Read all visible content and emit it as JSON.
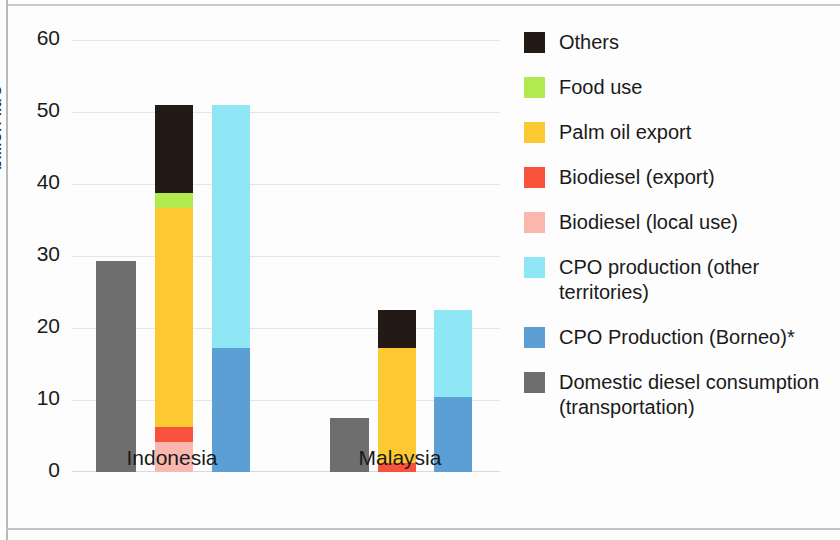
{
  "chart_data": {
    "type": "bar",
    "title": "",
    "subtitle": "",
    "xlabel": "",
    "ylabel": "billion litre",
    "ylim": [
      0,
      60
    ],
    "yticks": [
      0,
      10,
      20,
      30,
      40,
      50,
      60
    ],
    "ytick_labels": [
      "0",
      "10",
      "20",
      "30",
      "40",
      "50",
      "60"
    ],
    "grid": true,
    "legend_position": "right",
    "categories": [
      "Indonesia",
      "Malaysia"
    ],
    "stacked": true,
    "note": "* asterisk on CPO Production (Borneo) legend entry",
    "series": [
      {
        "name": "Others",
        "color": "#231a16",
        "values_by_bar": {
          "indonesia_palm_oil_use": 12.2,
          "malaysia_palm_oil_use": 5.3
        }
      },
      {
        "name": "Food use",
        "color": "#b0ea4e",
        "values_by_bar": {
          "indonesia_palm_oil_use": 2.1,
          "malaysia_palm_oil_use": 0
        }
      },
      {
        "name": "Palm oil export",
        "color": "#fcc932",
        "values_by_bar": {
          "indonesia_palm_oil_use": 30.4,
          "malaysia_palm_oil_use": 16.0
        }
      },
      {
        "name": "Biodiesel (export)",
        "color": "#f9523c",
        "values_by_bar": {
          "indonesia_palm_oil_use": 2.1,
          "malaysia_palm_oil_use": 1.2
        }
      },
      {
        "name": "Biodiesel (local use)",
        "color": "#f9b7ad",
        "values_by_bar": {
          "indonesia_palm_oil_use": 4.2,
          "malaysia_palm_oil_use": 0
        }
      },
      {
        "name": "CPO production (other territories)",
        "color": "#8fe7f5",
        "values_by_bar": {
          "indonesia_cpo_production": 33.8,
          "malaysia_cpo_production": 12.1
        }
      },
      {
        "name": "CPO Production (Borneo)*",
        "color": "#5b9fd4",
        "values_by_bar": {
          "indonesia_cpo_production": 17.2,
          "malaysia_cpo_production": 10.4
        }
      },
      {
        "name": "Domestic diesel consumption\n(transportation)",
        "color": "#6e6e6e",
        "values_by_bar": {
          "indonesia_diesel": 29.3,
          "malaysia_diesel": 7.5
        }
      }
    ],
    "bars": [
      {
        "id": "indonesia-diesel-bar",
        "group": "Indonesia",
        "total": 29.3,
        "segments": [
          {
            "series": "Domestic diesel consumption (transportation)",
            "value": 29.3,
            "color": "#6e6e6e"
          }
        ]
      },
      {
        "id": "indonesia-palm-oil-use-bar",
        "group": "Indonesia",
        "total": 51.0,
        "segments": [
          {
            "series": "Biodiesel (local use)",
            "value": 4.2,
            "color": "#f9b7ad"
          },
          {
            "series": "Biodiesel (export)",
            "value": 2.1,
            "color": "#f9523c"
          },
          {
            "series": "Palm oil export",
            "value": 30.4,
            "color": "#fcc932"
          },
          {
            "series": "Food use",
            "value": 2.1,
            "color": "#b0ea4e"
          },
          {
            "series": "Others",
            "value": 12.2,
            "color": "#231a16"
          }
        ]
      },
      {
        "id": "indonesia-cpo-production-bar",
        "group": "Indonesia",
        "total": 51.0,
        "segments": [
          {
            "series": "CPO Production (Borneo)*",
            "value": 17.2,
            "color": "#5b9fd4"
          },
          {
            "series": "CPO production (other territories)",
            "value": 33.8,
            "color": "#8fe7f5"
          }
        ]
      },
      {
        "id": "malaysia-diesel-bar",
        "group": "Malaysia",
        "total": 7.5,
        "segments": [
          {
            "series": "Domestic diesel consumption (transportation)",
            "value": 7.5,
            "color": "#6e6e6e"
          }
        ]
      },
      {
        "id": "malaysia-palm-oil-use-bar",
        "group": "Malaysia",
        "total": 22.5,
        "segments": [
          {
            "series": "Biodiesel (export)",
            "value": 1.2,
            "color": "#f9523c"
          },
          {
            "series": "Palm oil export",
            "value": 16.0,
            "color": "#fcc932"
          },
          {
            "series": "Others",
            "value": 5.3,
            "color": "#231a16"
          }
        ]
      },
      {
        "id": "malaysia-cpo-production-bar",
        "group": "Malaysia",
        "total": 22.5,
        "segments": [
          {
            "series": "CPO Production (Borneo)*",
            "value": 10.4,
            "color": "#5b9fd4"
          },
          {
            "series": "CPO production (other territories)",
            "value": 12.1,
            "color": "#8fe7f5"
          }
        ]
      }
    ]
  },
  "axis": {
    "y_label": "billion litre",
    "y_tick_labels": [
      "60",
      "50",
      "40",
      "30",
      "20",
      "10",
      "0"
    ],
    "x_tick_labels": [
      "Indonesia",
      "Malaysia"
    ]
  },
  "legend": {
    "items": [
      {
        "label": "Others",
        "color": "#231a16"
      },
      {
        "label": "Food use",
        "color": "#b0ea4e"
      },
      {
        "label": "Palm oil export",
        "color": "#fcc932"
      },
      {
        "label": "Biodiesel (export)",
        "color": "#f9523c"
      },
      {
        "label": "Biodiesel (local use)",
        "color": "#f9b7ad"
      },
      {
        "label": "CPO production (other territories)",
        "color": "#8fe7f5"
      },
      {
        "label": "CPO Production (Borneo)*",
        "color": "#5b9fd4"
      },
      {
        "label": "Domestic diesel consumption\n(transportation)",
        "color": "#6e6e6e"
      }
    ]
  }
}
